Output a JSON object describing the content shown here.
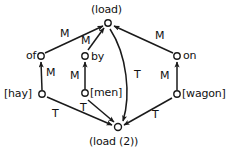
{
  "diagram": {
    "title_text": "",
    "stroke_color": "#1a1a1a",
    "background_color": "#ffffff",
    "nodes": [
      {
        "id": "load",
        "label": "(load)",
        "label_pos": "above",
        "x": 108,
        "y": 23
      },
      {
        "id": "of",
        "label": "of",
        "label_pos": "left",
        "x": 41,
        "y": 56
      },
      {
        "id": "by",
        "label": "by",
        "label_pos": "right",
        "x": 85,
        "y": 56
      },
      {
        "id": "on",
        "label": "on",
        "label_pos": "right",
        "x": 177,
        "y": 56
      },
      {
        "id": "hay",
        "label": "[hay]",
        "label_pos": "left",
        "x": 42,
        "y": 94
      },
      {
        "id": "men",
        "label": "[men]",
        "label_pos": "right",
        "x": 85,
        "y": 93
      },
      {
        "id": "wagon",
        "label": "[wagon]",
        "label_pos": "right",
        "x": 177,
        "y": 94
      },
      {
        "id": "load2",
        "label": "(load (2))",
        "label_pos": "below",
        "x": 118,
        "y": 127
      }
    ],
    "edges": [
      {
        "id": "of-load",
        "from": "of",
        "to": "load",
        "label": "M",
        "label_x": 62,
        "label_y": 33
      },
      {
        "id": "by-load",
        "from": "by",
        "to": "load",
        "label": "M",
        "label_x": 85,
        "label_y": 41
      },
      {
        "id": "on-load",
        "from": "on",
        "to": "load",
        "label": "M",
        "label_x": 159,
        "label_y": 36
      },
      {
        "id": "hay-of",
        "from": "hay",
        "to": "of",
        "label": "M",
        "label_x": 47,
        "label_y": 73
      },
      {
        "id": "men-by",
        "from": "men",
        "to": "by",
        "label": "M",
        "label_x": 73,
        "label_y": 76
      },
      {
        "id": "wagon-on",
        "from": "wagon",
        "to": "on",
        "label": "M",
        "label_x": 163,
        "label_y": 76
      },
      {
        "id": "hay-load2",
        "from": "hay",
        "to": "load2",
        "label": "T",
        "label_x": 55,
        "label_y": 113
      },
      {
        "id": "men-load2",
        "from": "men",
        "to": "load2",
        "label": "T",
        "label_x": 83,
        "label_y": 107
      },
      {
        "id": "wagon-load2",
        "from": "wagon",
        "to": "load2",
        "label": "T",
        "label_x": 155,
        "label_y": 114
      },
      {
        "id": "load-load2",
        "from": "load",
        "to": "load2",
        "label": "T",
        "label_x": 137,
        "label_y": 75
      }
    ],
    "edge_label_values": {
      "m": "M",
      "t": "T"
    }
  }
}
